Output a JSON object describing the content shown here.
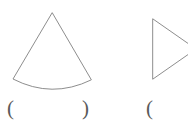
{
  "page": {
    "background_color": "#ffffff",
    "width": 188,
    "height": 126,
    "stroke_color": "#808080",
    "text_color": "#5a5a5a"
  },
  "figures": [
    {
      "id": "figure-a",
      "shape_name": "circular-sector",
      "description": "Circular sector (cone lateral surface net) with apex at top and curved arc at bottom",
      "apex": {
        "x": 52,
        "y": 13
      },
      "left_corner": {
        "x": 13,
        "y": 79
      },
      "right_corner": {
        "x": 91,
        "y": 80
      },
      "arc_lowest_point": {
        "x": 52,
        "y": 90
      },
      "svg_path": "M 52 13 L 13 79 Q 52 99 91 80 Z"
    },
    {
      "id": "figure-b",
      "shape_name": "right-pointing-triangle",
      "description": "Triangle with vertical left edge, apex pointing right, cropped by the right image edge",
      "top_left": {
        "x": 153,
        "y": 19
      },
      "bottom_left": {
        "x": 153,
        "y": 79
      },
      "apex": {
        "x": 196,
        "y": 49
      },
      "svg_path": "M 153 19 L 196 49 L 153 79 Z"
    }
  ],
  "answer_blanks": [
    {
      "id": "answer-blank-a",
      "open_paren": "(",
      "close_paren": ")",
      "value": "",
      "for_figure": "figure-a"
    },
    {
      "id": "answer-blank-b",
      "open_paren": "(",
      "close_paren": "",
      "value": "",
      "for_figure": "figure-b"
    }
  ]
}
